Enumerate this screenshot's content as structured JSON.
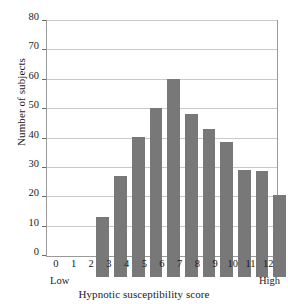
{
  "chart_data": {
    "type": "bar",
    "title": "",
    "xlabel": "Hypnotic susceptibility score",
    "ylabel": "Number of subjects",
    "categories": [
      "0",
      "1",
      "2",
      "3",
      "4",
      "5",
      "6",
      "7",
      "8",
      "9",
      "10",
      "11",
      "12"
    ],
    "values": [
      20.5,
      34.5,
      47.5,
      57.5,
      67.5,
      55.5,
      50.5,
      46,
      36.5,
      36,
      28,
      36,
      20.5
    ],
    "ylim": [
      0,
      80
    ],
    "yticks": [
      0,
      10,
      20,
      30,
      40,
      50,
      60,
      70,
      80
    ],
    "ytick_labels": [
      "0",
      "10",
      "20",
      "30",
      "40",
      "50",
      "60",
      "70",
      "80"
    ],
    "grid": "horizontal",
    "legend": "none",
    "bar_color": "#787878",
    "grid_color": "#c9c9c9",
    "frame_color": "#9a9a9a",
    "annotations": {
      "low": "Low",
      "high": "High"
    }
  }
}
